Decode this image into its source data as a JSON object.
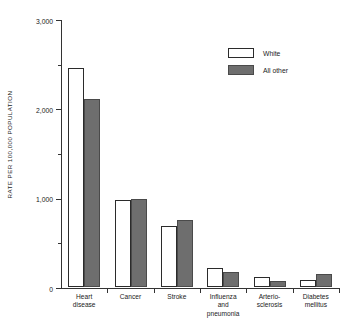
{
  "chart_data": {
    "type": "bar",
    "title": "",
    "subtitle": "",
    "xlabel": "",
    "ylabel": "RATE PER 100,000 POPULATION",
    "ylim": [
      0,
      3000
    ],
    "grid": false,
    "legend_position": "top-right",
    "y_major_ticks": [
      0,
      1000,
      2000,
      3000
    ],
    "y_major_tick_labels": [
      "0",
      "1,000",
      "2,000",
      "3,000"
    ],
    "y_minor_ticks": [
      500,
      1500,
      2500
    ],
    "categories": [
      "Heart\ndisease",
      "Cancer",
      "Stroke",
      "Influenza\nand\npneumonia",
      "Arterio-\nsclerosis",
      "Diabetes\nmellitus"
    ],
    "series": [
      {
        "name": "White",
        "color": "#ffffff",
        "values": [
          2450,
          975,
          680,
          215,
          110,
          80
        ]
      },
      {
        "name": "All other",
        "color": "#6e6e6e",
        "values": [
          2100,
          990,
          750,
          170,
          70,
          150
        ]
      }
    ]
  },
  "legend": {
    "items": [
      {
        "label": "White",
        "swatch": "white"
      },
      {
        "label": "All other",
        "swatch": "other"
      }
    ]
  }
}
